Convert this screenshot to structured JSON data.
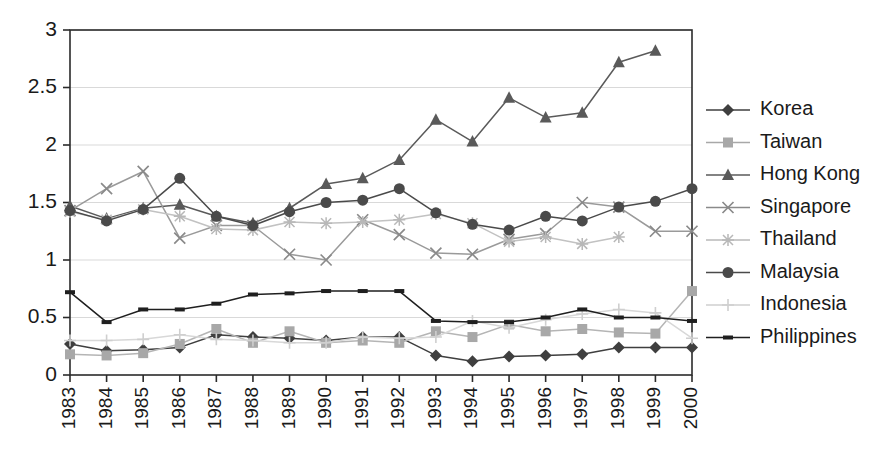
{
  "chart_data": {
    "type": "line",
    "title": "",
    "subtitle": "",
    "xlabel": "",
    "ylabel": "",
    "xlim": [
      1983,
      2000
    ],
    "ylim": [
      0,
      3
    ],
    "yticks": [
      "0",
      "0.5",
      "1",
      "1.5",
      "2",
      "2.5",
      "3"
    ],
    "ytick_values": [
      0,
      0.5,
      1,
      1.5,
      2,
      2.5,
      3
    ],
    "grid": "horizontal",
    "legend_position": "right",
    "x": [
      1983,
      1984,
      1985,
      1986,
      1987,
      1988,
      1989,
      1990,
      1991,
      1992,
      1993,
      1994,
      1995,
      1996,
      1997,
      1998,
      1999,
      2000
    ],
    "categories": [
      "1983",
      "1984",
      "1985",
      "1986",
      "1987",
      "1988",
      "1989",
      "1990",
      "1991",
      "1992",
      "1993",
      "1994",
      "1995",
      "1996",
      "1997",
      "1998",
      "1999",
      "2000"
    ],
    "series": [
      {
        "name": "Korea",
        "marker": "diamond",
        "color": "#3f3f3f",
        "line_color": "#3f3f3f",
        "values": [
          0.27,
          0.21,
          0.22,
          0.24,
          0.35,
          0.33,
          0.32,
          0.3,
          0.33,
          0.33,
          0.17,
          0.12,
          0.16,
          0.17,
          0.18,
          0.24,
          0.24,
          0.24
        ]
      },
      {
        "name": "Taiwan",
        "marker": "square",
        "color": "#a8a8a8",
        "line_color": "#b5b5b5",
        "values": [
          0.18,
          0.17,
          0.19,
          0.27,
          0.4,
          0.28,
          0.38,
          0.28,
          0.3,
          0.28,
          0.38,
          0.33,
          0.44,
          0.38,
          0.4,
          0.37,
          0.36,
          0.73
        ]
      },
      {
        "name": "Hong Kong",
        "marker": "triangle",
        "color": "#5a5a5a",
        "line_color": "#5a5a5a",
        "values": [
          1.47,
          1.36,
          1.45,
          1.48,
          1.38,
          1.32,
          1.45,
          1.66,
          1.71,
          1.87,
          2.22,
          2.03,
          2.41,
          2.24,
          2.28,
          2.72,
          2.82,
          null
        ]
      },
      {
        "name": "Singapore",
        "marker": "x",
        "color": "#8a8a8a",
        "line_color": "#9a9a9a",
        "values": [
          1.43,
          1.62,
          1.77,
          1.19,
          1.3,
          1.3,
          1.05,
          1.0,
          1.35,
          1.22,
          1.06,
          1.05,
          1.18,
          1.23,
          1.5,
          1.46,
          1.25,
          1.25
        ]
      },
      {
        "name": "Thailand",
        "marker": "star",
        "color": "#b8b8b8",
        "line_color": "#c2c2c2",
        "values": [
          1.42,
          1.35,
          1.44,
          1.38,
          1.27,
          1.26,
          1.33,
          1.32,
          1.33,
          1.35,
          1.4,
          1.32,
          1.16,
          1.2,
          1.14,
          1.2,
          null,
          null
        ]
      },
      {
        "name": "Malaysia",
        "marker": "circle",
        "color": "#4a4a4a",
        "line_color": "#4a4a4a",
        "values": [
          1.43,
          1.34,
          1.44,
          1.71,
          1.38,
          1.3,
          1.42,
          1.5,
          1.52,
          1.62,
          1.41,
          1.31,
          1.26,
          1.38,
          1.34,
          1.46,
          1.51,
          1.62
        ]
      },
      {
        "name": "Indonesia",
        "marker": "plus",
        "color": "#cfcfcf",
        "line_color": "#d8d8d8",
        "values": [
          0.3,
          0.3,
          0.31,
          0.35,
          0.31,
          0.3,
          0.28,
          0.28,
          0.33,
          0.32,
          0.33,
          0.47,
          0.41,
          0.48,
          0.53,
          0.57,
          0.54,
          0.32
        ]
      },
      {
        "name": "Philippines",
        "marker": "dash",
        "color": "#1f1f1f",
        "line_color": "#1f1f1f",
        "values": [
          0.72,
          0.46,
          0.57,
          0.57,
          0.62,
          0.7,
          0.71,
          0.73,
          0.73,
          0.73,
          0.47,
          0.46,
          0.46,
          0.5,
          0.57,
          0.5,
          0.5,
          0.47
        ]
      }
    ],
    "legend": [
      {
        "label": "Korea",
        "marker": "diamond",
        "color": "#3f3f3f"
      },
      {
        "label": "Taiwan",
        "marker": "square",
        "color": "#a8a8a8"
      },
      {
        "label": "Hong Kong",
        "marker": "triangle",
        "color": "#5a5a5a"
      },
      {
        "label": "Singapore",
        "marker": "x",
        "color": "#8a8a8a"
      },
      {
        "label": "Thailand",
        "marker": "star",
        "color": "#b8b8b8"
      },
      {
        "label": "Malaysia",
        "marker": "circle",
        "color": "#4a4a4a"
      },
      {
        "label": "Indonesia",
        "marker": "plus",
        "color": "#cfcfcf"
      },
      {
        "label": "Philippines",
        "marker": "dash",
        "color": "#1f1f1f"
      }
    ],
    "colors": {
      "axis": "#2b2b2b",
      "grid": "#d9d9d9",
      "background": "#ffffff",
      "text": "#1a1a1a"
    },
    "plot_area": {
      "left": 70,
      "top": 30,
      "right": 692,
      "bottom": 375
    }
  }
}
